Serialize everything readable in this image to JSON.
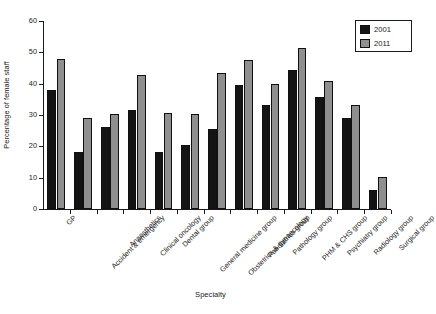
{
  "chart_data": {
    "type": "bar",
    "title": "",
    "xlabel": "Specialty",
    "ylabel": "Percentage of female staff",
    "ylim": [
      0,
      60
    ],
    "yticks": [
      0,
      10,
      20,
      30,
      40,
      50,
      60
    ],
    "grid": false,
    "legend_position": "top-right",
    "categories": [
      "GP",
      "Accident & emergency",
      "Anaesthetics",
      "Clinical oncology",
      "Dental group",
      "General medicine group",
      "Obstetrics & gynaecology",
      "Paediatrics group",
      "Pathology group",
      "PHM & CHS group",
      "Psychiatry group",
      "Radiology group",
      "Surgical group"
    ],
    "series": [
      {
        "name": "2001",
        "color": "#141414",
        "values": [
          38.0,
          18.2,
          26.3,
          31.5,
          18.3,
          20.3,
          25.5,
          39.5,
          33.2,
          44.3,
          35.7,
          29.0,
          6.2
        ]
      },
      {
        "name": "2011",
        "color": "#8f8f8f",
        "values": [
          47.8,
          29.0,
          30.4,
          42.8,
          30.5,
          30.4,
          43.3,
          47.4,
          40.0,
          51.5,
          40.7,
          33.2,
          10.3
        ]
      }
    ]
  },
  "legend": {
    "entries": [
      {
        "label": "2001",
        "swatch": "black-square-icon"
      },
      {
        "label": "2011",
        "swatch": "gray-square-icon"
      }
    ]
  }
}
